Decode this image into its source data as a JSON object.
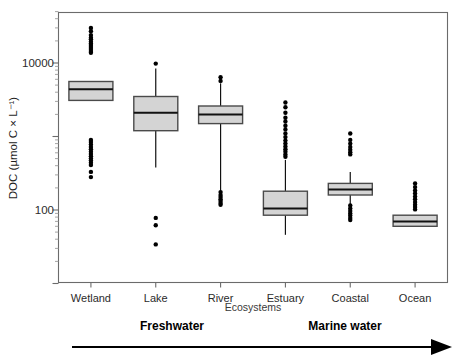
{
  "chart_data": {
    "type": "box",
    "title": "",
    "xlabel": "Ecosystems",
    "ylabel": "DOC (µmol C × L⁻¹)",
    "yscale": "log",
    "ylim": [
      25,
      40000
    ],
    "ytick_labels": [
      "10000",
      "100"
    ],
    "ytick_values": [
      10000,
      100
    ],
    "grid": false,
    "legend": null,
    "categories": [
      "Wetland",
      "Lake",
      "River",
      "Estuary",
      "Coastal",
      "Ocean"
    ],
    "series": [
      {
        "name": "Wetland",
        "q1": 3100,
        "median": 4400,
        "q3": 5600,
        "whisker_low": 3100,
        "whisker_high": 5600,
        "outliers_high": [
          30000,
          27000,
          24000,
          22000,
          21000,
          19500,
          18500,
          17500,
          16500,
          15500,
          14500,
          13800
        ],
        "outliers_low": [
          900,
          840,
          780,
          720,
          670,
          620,
          580,
          540,
          500,
          470,
          440,
          410,
          330,
          280
        ]
      },
      {
        "name": "Lake",
        "q1": 1200,
        "median": 2100,
        "q3": 3500,
        "whisker_low": 380,
        "whisker_high": 8400,
        "outliers_high": [
          9800
        ],
        "outliers_low": [
          78,
          62,
          34
        ]
      },
      {
        "name": "River",
        "q1": 1500,
        "median": 2000,
        "q3": 2600,
        "whisker_low": 140,
        "whisker_high": 5300,
        "outliers_high": [
          6400,
          5700
        ],
        "outliers_low": [
          175,
          160,
          150,
          140,
          132,
          124,
          118
        ]
      },
      {
        "name": "Estuary",
        "q1": 85,
        "median": 105,
        "q3": 180,
        "whisker_low": 46,
        "whisker_high": 480,
        "outliers_high": [
          2900,
          2500,
          2100,
          1800,
          1600,
          1400,
          1250,
          1100,
          980,
          880,
          800,
          730,
          670,
          620,
          570,
          530
        ],
        "outliers_low": []
      },
      {
        "name": "Coastal",
        "q1": 160,
        "median": 190,
        "q3": 230,
        "whisker_low": 118,
        "whisker_high": 330,
        "outliers_high": [
          1100,
          900,
          800,
          720,
          660,
          610,
          570
        ],
        "outliers_low": [
          115,
          105,
          97,
          90,
          84,
          78,
          73
        ]
      },
      {
        "name": "Ocean",
        "q1": 60,
        "median": 70,
        "q3": 85,
        "whisker_low": 60,
        "whisker_high": 85,
        "outliers_high": [
          230,
          205,
          185,
          168,
          152,
          140,
          128,
          118,
          110,
          102
        ],
        "outliers_low": []
      }
    ],
    "annotations": [
      {
        "text": "Freshwater",
        "role": "gradient-label-left"
      },
      {
        "text": "Marine water",
        "role": "gradient-label-right"
      }
    ],
    "arrow": {
      "direction": "left-to-right",
      "label": "salinity-gradient-arrow"
    }
  },
  "axes": {
    "y_title": "DOC (µmol C × L⁻¹)",
    "x_title": "Ecosystems",
    "y_labels": [
      "10000",
      "100"
    ],
    "x_labels": [
      "Wetland",
      "Lake",
      "River",
      "Estuary",
      "Coastal",
      "Ocean"
    ]
  },
  "annotations": {
    "freshwater": "Freshwater",
    "marine": "Marine water"
  },
  "colors": {
    "box_fill": "#d4d4d4",
    "box_stroke": "#4a4a4a",
    "median": "#111111",
    "outlier": "#000000",
    "frame": "#6b6b6b",
    "text": "#1f1f1f"
  }
}
